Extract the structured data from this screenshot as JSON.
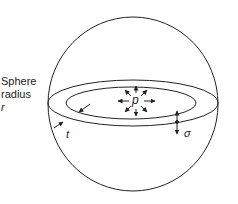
{
  "diagram": {
    "labels": {
      "sphere_line1": "Sphere",
      "sphere_line2": "radius",
      "radius_symbol": "r",
      "thickness_symbol": "t",
      "pressure_symbol": "p",
      "stress_symbol": "σ"
    },
    "colors": {
      "stroke": "#222222",
      "background": "#ffffff"
    }
  }
}
